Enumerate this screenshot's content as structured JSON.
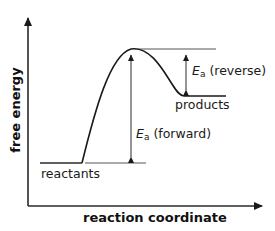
{
  "diagram": {
    "type": "energy-profile",
    "axes": {
      "y_label": "free energy",
      "x_label": "reaction coordinate"
    },
    "levels": {
      "reactants": "reactants",
      "products": "products"
    },
    "annotations": {
      "forward": {
        "symbol": "E",
        "subscript": "a",
        "text": "(forward)"
      },
      "reverse": {
        "symbol": "E",
        "subscript": "a",
        "text": "(reverse)"
      }
    },
    "colors": {
      "line": "#1a1a1a",
      "background": "#ffffff"
    }
  }
}
